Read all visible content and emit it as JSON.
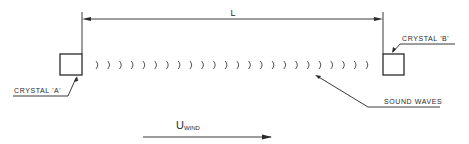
{
  "diagram": {
    "dimension": {
      "label": "L"
    },
    "crystal_a": {
      "label": "CRYSTAL 'A'"
    },
    "crystal_b": {
      "label": "CRYSTAL 'B'"
    },
    "sound_waves": {
      "label": "SOUND WAVES",
      "count": 24
    },
    "wind": {
      "label": "U",
      "subscript": "WIND"
    }
  }
}
